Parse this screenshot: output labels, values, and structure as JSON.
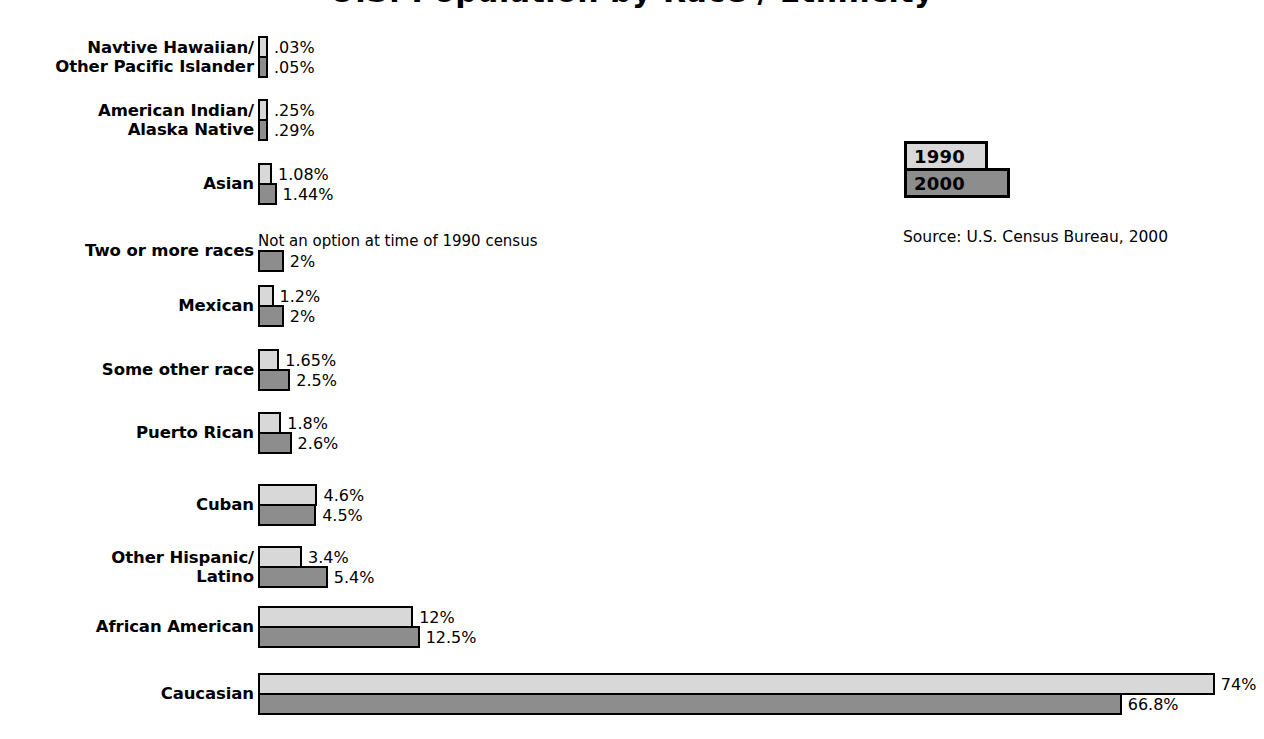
{
  "title": "U.S. Population by Race / Ethnicity",
  "legend": {
    "items": [
      {
        "label": "1990",
        "color": "#d8d8d8"
      },
      {
        "label": "2000",
        "color": "#8d8d8d"
      }
    ]
  },
  "source": "Source: U.S. Census Bureau, 2000",
  "notes": {
    "not_an_option": "Not an option at time of 1990 census"
  },
  "chart_data": {
    "type": "bar",
    "title": "U.S. Population by Race / Ethnicity",
    "xlabel": "",
    "ylabel": "",
    "orientation": "horizontal",
    "grid": false,
    "legend_position": "upper-right",
    "xlim": [
      0,
      74
    ],
    "categories": [
      "Navtive Hawaiian/\nOther Pacific Islander",
      "American Indian/\nAlaska Native",
      "Asian",
      "Two or more races",
      "Mexican",
      "Some other race",
      "Puerto Rican",
      "Cuban",
      "Other Hispanic/\nLatino",
      "African American",
      "Caucasian"
    ],
    "series": [
      {
        "name": "1990",
        "color": "#d8d8d8",
        "values": [
          0.03,
          0.25,
          1.08,
          null,
          1.2,
          1.65,
          1.8,
          4.6,
          3.4,
          12,
          74
        ],
        "labels": [
          ".03%",
          ".25%",
          "1.08%",
          "Not an option at time of 1990 census",
          "1.2%",
          "1.65%",
          "1.8%",
          "4.6%",
          "3.4%",
          "12%",
          "74%"
        ]
      },
      {
        "name": "2000",
        "color": "#8d8d8d",
        "values": [
          0.05,
          0.29,
          1.44,
          2,
          2,
          2.5,
          2.6,
          4.5,
          5.4,
          12.5,
          66.8
        ],
        "labels": [
          ".05%",
          ".29%",
          "1.44%",
          "2%",
          "2%",
          "2.5%",
          "2.6%",
          "4.5%",
          "5.4%",
          "12.5%",
          "66.8%"
        ]
      }
    ]
  },
  "rows": [
    {
      "label": "Navtive Hawaiian/\nOther Pacific Islander",
      "top": 36,
      "v1990": 0.03,
      "l1990": ".03%",
      "v2000": 0.05,
      "l2000": ".05%"
    },
    {
      "label": "American Indian/\nAlaska Native",
      "top": 99,
      "v1990": 0.25,
      "l1990": ".25%",
      "v2000": 0.29,
      "l2000": ".29%"
    },
    {
      "label": "Asian",
      "top": 163,
      "v1990": 1.08,
      "l1990": "1.08%",
      "v2000": 1.44,
      "l2000": "1.44%"
    },
    {
      "label": "Two or more races",
      "top": 230,
      "v1990": null,
      "l1990": "Not an option at time of 1990 census",
      "v2000": 2,
      "l2000": "2%"
    },
    {
      "label": "Mexican",
      "top": 285,
      "v1990": 1.2,
      "l1990": "1.2%",
      "v2000": 2,
      "l2000": "2%"
    },
    {
      "label": "Some other race",
      "top": 349,
      "v1990": 1.65,
      "l1990": "1.65%",
      "v2000": 2.5,
      "l2000": "2.5%"
    },
    {
      "label": "Puerto Rican",
      "top": 412,
      "v1990": 1.8,
      "l1990": "1.8%",
      "v2000": 2.6,
      "l2000": "2.6%"
    },
    {
      "label": "Cuban",
      "top": 484,
      "v1990": 4.6,
      "l1990": "4.6%",
      "v2000": 4.5,
      "l2000": "4.5%"
    },
    {
      "label": "Other Hispanic/\nLatino",
      "top": 546,
      "v1990": 3.4,
      "l1990": "3.4%",
      "v2000": 5.4,
      "l2000": "5.4%"
    },
    {
      "label": "African American",
      "top": 606,
      "v1990": 12,
      "l1990": "12%",
      "v2000": 12.5,
      "l2000": "12.5%"
    },
    {
      "label": "Caucasian",
      "top": 673,
      "v1990": 74,
      "l1990": "74%",
      "v2000": 66.8,
      "l2000": "66.8%"
    }
  ],
  "scale": {
    "px_per_percent": 12.93,
    "bar_origin_x": 258,
    "min_bar_px": 10
  }
}
